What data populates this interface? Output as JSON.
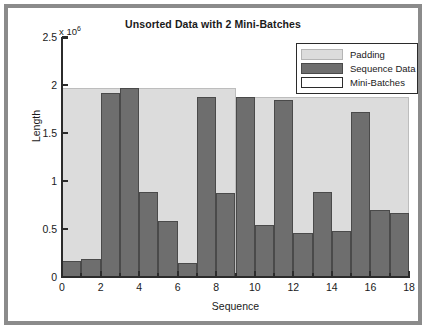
{
  "chart_data": {
    "type": "bar",
    "title": "Unsorted Data with 2 Mini-Batches",
    "xlabel": "Sequence",
    "ylabel": "Length",
    "y_exponent_label": "x 10",
    "y_exponent_value": "6",
    "y_scale_multiplier": 1000000,
    "xlim": [
      0,
      18
    ],
    "ylim": [
      0,
      2.5
    ],
    "xticks": [
      0,
      2,
      4,
      6,
      8,
      10,
      12,
      14,
      16,
      18
    ],
    "xtick_labels": [
      "0",
      "2",
      "4",
      "6",
      "8",
      "10",
      "12",
      "14",
      "16",
      "18"
    ],
    "yticks": [
      0,
      0.5,
      1,
      1.5,
      2,
      2.5
    ],
    "ytick_labels": [
      "0",
      "0.5",
      "1",
      "1.5",
      "2",
      "2.5"
    ],
    "grid": false,
    "legend_position": "top-right",
    "legend": [
      {
        "label": "Padding",
        "color": "#dcdcdc",
        "edge": "#b5b5b5"
      },
      {
        "label": "Sequence Data",
        "color": "#6e6e6e",
        "edge": "#4a4a4a"
      },
      {
        "label": "Mini-Batches",
        "color": "#ffffff",
        "edge": "#2b2b2b"
      }
    ],
    "categories": [
      1,
      2,
      3,
      4,
      5,
      6,
      7,
      8,
      9,
      10,
      11,
      12,
      13,
      14,
      15,
      16,
      17,
      18
    ],
    "series": [
      {
        "name": "Sequence Data",
        "values": [
          0.17,
          0.19,
          1.92,
          1.97,
          0.89,
          0.58,
          0.15,
          1.87,
          0.88,
          1.87,
          0.54,
          1.84,
          0.46,
          0.89,
          0.48,
          1.72,
          0.7,
          0.67
        ]
      },
      {
        "name": "Padding",
        "values": [
          1.8,
          1.78,
          0.05,
          0.0,
          1.08,
          1.39,
          1.82,
          0.1,
          1.09,
          0.0,
          1.33,
          0.03,
          1.41,
          0.98,
          1.39,
          0.15,
          1.17,
          1.2
        ]
      }
    ],
    "mini_batches": [
      {
        "name": "Mini-Batch 1",
        "start": 0,
        "end": 9,
        "pad_height": 1.97
      },
      {
        "name": "Mini-Batch 2",
        "start": 9,
        "end": 18,
        "pad_height": 1.87
      }
    ]
  },
  "colors": {
    "padding": "#dcdcdc",
    "padding_edge": "#bdbdbd",
    "sequence": "#6e6e6e",
    "sequence_edge": "#4a4a4a",
    "axis": "#2b2b2b",
    "frame": "#8b8b8b",
    "background": "#ffffff"
  }
}
